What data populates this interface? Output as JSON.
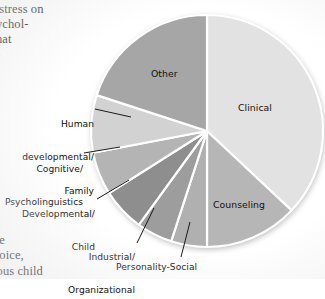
{
  "page": {
    "body_text_top": " stress on\nychol-\nnat\n-",
    "body_text_bottom": "1\nbe\nhoice,\nious child"
  },
  "chart_data": {
    "type": "pie",
    "title": "",
    "categories": [
      "Clinical",
      "Counseling",
      "Personality-Social",
      "Industrial/\nOrganizational",
      "Developmental/\nChild",
      "Cognitive/\nPsycholinguistics",
      "Human\ndevelopmental/\nFamily",
      "Other"
    ],
    "values": [
      37,
      13,
      5,
      5,
      6,
      6,
      8,
      20
    ],
    "colors": [
      "#e2e2e2",
      "#b6b6b6",
      "#b0b0b0",
      "#9d9d9d",
      "#8e8e8e",
      "#b4b4b4",
      "#d2d2d2",
      "#a6a6a6"
    ],
    "label_placement": [
      "inside",
      "inside",
      "leader",
      "leader",
      "leader",
      "leader",
      "leader",
      "inside"
    ],
    "start_angle_deg": 0,
    "direction": "clockwise",
    "legend": "none",
    "grid": false,
    "xlabel": "",
    "ylabel": ""
  },
  "labels": {
    "clinical": "Clinical",
    "counseling": "Counseling",
    "other": "Other",
    "personality_social": "Personality-Social",
    "industrial_l1": "Industrial/",
    "industrial_l2": "Organizational",
    "developmental_l1": "Developmental/",
    "developmental_l2": "Child",
    "cognitive_l1": "Cognitive/",
    "cognitive_l2": "Psycholinguistics",
    "human_l1": "Human",
    "human_l2": "developmental/",
    "human_l3": "Family"
  }
}
